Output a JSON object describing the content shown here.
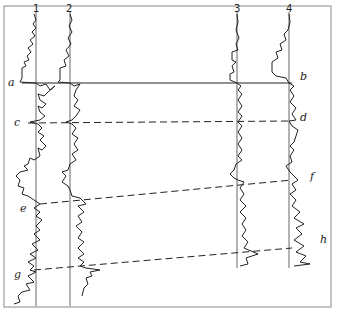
{
  "wells": [
    {
      "id": "1",
      "label": "1",
      "axis_x": 36,
      "top": 12,
      "bottom": 306
    },
    {
      "id": "2",
      "label": "2",
      "axis_x": 70,
      "top": 12,
      "bottom": 306
    },
    {
      "id": "3",
      "label": "3",
      "axis_x": 237,
      "top": 12,
      "bottom": 268
    },
    {
      "id": "4",
      "label": "4",
      "axis_x": 289,
      "top": 12,
      "bottom": 268
    }
  ],
  "correlation_lines": [
    {
      "name": "a-b",
      "left_label": "a",
      "right_label": "b",
      "style": "solid",
      "y_left": 83,
      "y_right": 83
    },
    {
      "name": "c-d",
      "left_label": "c",
      "right_label": "d",
      "style": "dashed",
      "y_left": 123,
      "y_right": 121
    },
    {
      "name": "e-f",
      "left_label": "e",
      "right_label": "f",
      "style": "dashed",
      "y_left": 204,
      "y_right": 180
    },
    {
      "name": "g-h",
      "left_label": "g",
      "right_label": "h",
      "style": "dashed",
      "y_left": 270,
      "y_right": 248
    }
  ],
  "labels": {
    "a": "a",
    "b": "b",
    "c": "c",
    "d": "d",
    "e": "e",
    "f": "f",
    "g": "g",
    "h": "h",
    "w1": "1",
    "w2": "2",
    "w3": "3",
    "w4": "4"
  },
  "colors": {
    "ink": "#222222",
    "frame": "#888888",
    "axis": "#555555",
    "background": "#ffffff"
  }
}
